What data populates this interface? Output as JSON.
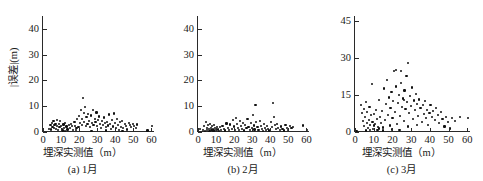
{
  "figure": {
    "panel_count": 3,
    "marker_color": "#111111",
    "axis_color": "#2a2a2a",
    "background": "#ffffff"
  },
  "chart_data": [
    {
      "type": "scatter",
      "title": "",
      "caption": "(a) 1月",
      "xlabel": "埋深实测值（m）",
      "ylabel": "|误差|(m)",
      "xlim": [
        0,
        62
      ],
      "ylim": [
        0,
        45
      ],
      "xticks": [
        0,
        10,
        20,
        30,
        40,
        50,
        60
      ],
      "xticklabels": [
        "0",
        "10",
        "20",
        "30",
        "40",
        "50",
        "60"
      ],
      "yticks": [
        0,
        10,
        20,
        30,
        40
      ],
      "yticklabels": [
        "0",
        "10",
        "20",
        "30",
        "40"
      ],
      "grid": false,
      "legend": false,
      "points": [
        [
          3.4,
          1.2
        ],
        [
          4.1,
          2.8
        ],
        [
          4.6,
          1.0
        ],
        [
          5.0,
          3.6
        ],
        [
          5.3,
          2.0
        ],
        [
          5.8,
          4.4
        ],
        [
          6.1,
          1.5
        ],
        [
          6.4,
          2.6
        ],
        [
          6.9,
          3.2
        ],
        [
          7.2,
          1.1
        ],
        [
          7.6,
          4.6
        ],
        [
          7.9,
          2.2
        ],
        [
          8.3,
          0.8
        ],
        [
          8.7,
          3.0
        ],
        [
          9.1,
          1.8
        ],
        [
          9.5,
          4.2
        ],
        [
          9.9,
          2.4
        ],
        [
          10.4,
          1.3
        ],
        [
          10.8,
          0.6
        ],
        [
          11.3,
          2.9
        ],
        [
          11.8,
          1.6
        ],
        [
          12.4,
          3.4
        ],
        [
          13.0,
          2.1
        ],
        [
          13.6,
          1.0
        ],
        [
          14.2,
          2.6
        ],
        [
          14.9,
          1.4
        ],
        [
          15.5,
          3.1
        ],
        [
          16.1,
          2.2
        ],
        [
          16.8,
          0.9
        ],
        [
          17.4,
          3.8
        ],
        [
          17.9,
          2.4
        ],
        [
          18.5,
          1.7
        ],
        [
          19.0,
          4.9
        ],
        [
          19.6,
          2.0
        ],
        [
          20.1,
          6.2
        ],
        [
          20.6,
          3.4
        ],
        [
          21.0,
          8.6
        ],
        [
          21.4,
          5.1
        ],
        [
          21.8,
          2.6
        ],
        [
          22.1,
          13.1
        ],
        [
          22.5,
          7.3
        ],
        [
          22.9,
          4.0
        ],
        [
          23.3,
          9.6
        ],
        [
          23.7,
          2.2
        ],
        [
          24.1,
          5.8
        ],
        [
          24.6,
          3.1
        ],
        [
          25.0,
          7.0
        ],
        [
          25.5,
          4.4
        ],
        [
          26.0,
          1.9
        ],
        [
          26.5,
          6.4
        ],
        [
          27.0,
          3.6
        ],
        [
          27.5,
          8.4
        ],
        [
          28.0,
          2.8
        ],
        [
          28.6,
          5.2
        ],
        [
          29.1,
          3.9
        ],
        [
          29.6,
          7.6
        ],
        [
          30.1,
          2.3
        ],
        [
          30.6,
          4.8
        ],
        [
          31.1,
          6.0
        ],
        [
          31.6,
          3.2
        ],
        [
          32.1,
          1.5
        ],
        [
          32.7,
          4.2
        ],
        [
          33.2,
          2.7
        ],
        [
          33.8,
          5.6
        ],
        [
          34.3,
          3.4
        ],
        [
          34.9,
          1.8
        ],
        [
          35.4,
          4.0
        ],
        [
          36.0,
          2.5
        ],
        [
          36.6,
          6.8
        ],
        [
          37.1,
          3.0
        ],
        [
          37.7,
          1.2
        ],
        [
          38.2,
          4.6
        ],
        [
          38.8,
          2.1
        ],
        [
          39.3,
          7.2
        ],
        [
          39.8,
          3.6
        ],
        [
          40.3,
          1.4
        ],
        [
          40.9,
          5.0
        ],
        [
          41.5,
          2.8
        ],
        [
          42.0,
          0.7
        ],
        [
          42.6,
          3.8
        ],
        [
          43.2,
          2.0
        ],
        [
          43.9,
          4.4
        ],
        [
          44.5,
          1.6
        ],
        [
          45.2,
          3.0
        ],
        [
          45.9,
          2.3
        ],
        [
          46.6,
          1.0
        ],
        [
          47.4,
          3.4
        ],
        [
          48.1,
          2.6
        ],
        [
          48.9,
          1.8
        ],
        [
          49.7,
          3.2
        ],
        [
          50.5,
          2.2
        ],
        [
          51.3,
          1.4
        ],
        [
          52.1,
          2.9
        ],
        [
          57.8,
          0.6
        ],
        [
          60.4,
          2.4
        ],
        [
          12.0,
          0.5
        ],
        [
          18.2,
          0.7
        ],
        [
          26.8,
          0.4
        ],
        [
          35.0,
          0.6
        ],
        [
          44.0,
          0.5
        ]
      ]
    },
    {
      "type": "scatter",
      "title": "",
      "caption": "(b) 2月",
      "xlabel": "埋深实测值（m）",
      "ylabel": "",
      "xlim": [
        0,
        62
      ],
      "ylim": [
        0,
        45
      ],
      "xticks": [
        0,
        10,
        20,
        30,
        40,
        50,
        60
      ],
      "xticklabels": [
        "0",
        "10",
        "20",
        "30",
        "40",
        "50",
        "60"
      ],
      "yticks": [
        0,
        10,
        20,
        30,
        40
      ],
      "yticklabels": [
        "0",
        "10",
        "20",
        "30",
        "40"
      ],
      "grid": false,
      "legend": false,
      "points": [
        [
          2.8,
          0.9
        ],
        [
          3.4,
          2.2
        ],
        [
          3.9,
          0.5
        ],
        [
          4.3,
          3.9
        ],
        [
          4.8,
          1.4
        ],
        [
          5.2,
          0.7
        ],
        [
          5.6,
          2.6
        ],
        [
          6.0,
          1.1
        ],
        [
          6.4,
          0.4
        ],
        [
          6.8,
          3.1
        ],
        [
          7.1,
          1.7
        ],
        [
          7.5,
          0.8
        ],
        [
          7.9,
          2.3
        ],
        [
          8.2,
          1.2
        ],
        [
          8.6,
          0.6
        ],
        [
          9.0,
          2.8
        ],
        [
          9.4,
          1.5
        ],
        [
          9.8,
          0.9
        ],
        [
          10.3,
          2.0
        ],
        [
          10.9,
          1.0
        ],
        [
          11.5,
          0.5
        ],
        [
          12.2,
          1.8
        ],
        [
          12.9,
          0.7
        ],
        [
          13.6,
          2.4
        ],
        [
          14.3,
          1.2
        ],
        [
          15.0,
          0.6
        ],
        [
          15.8,
          3.3
        ],
        [
          16.5,
          1.6
        ],
        [
          17.2,
          0.8
        ],
        [
          17.9,
          2.9
        ],
        [
          18.6,
          1.3
        ],
        [
          19.2,
          4.8
        ],
        [
          19.8,
          2.1
        ],
        [
          20.4,
          0.7
        ],
        [
          21.0,
          5.4
        ],
        [
          21.6,
          3.0
        ],
        [
          22.1,
          1.5
        ],
        [
          22.7,
          0.9
        ],
        [
          23.2,
          4.2
        ],
        [
          23.8,
          2.3
        ],
        [
          24.4,
          1.1
        ],
        [
          25.0,
          3.6
        ],
        [
          25.6,
          0.6
        ],
        [
          26.2,
          2.7
        ],
        [
          26.8,
          1.4
        ],
        [
          27.4,
          5.0
        ],
        [
          28.0,
          2.0
        ],
        [
          28.6,
          0.8
        ],
        [
          29.2,
          3.4
        ],
        [
          29.8,
          1.7
        ],
        [
          30.3,
          6.6
        ],
        [
          30.8,
          2.5
        ],
        [
          31.3,
          1.0
        ],
        [
          31.8,
          10.4
        ],
        [
          32.3,
          3.8
        ],
        [
          32.9,
          1.9
        ],
        [
          33.5,
          0.7
        ],
        [
          34.1,
          4.4
        ],
        [
          34.7,
          2.2
        ],
        [
          35.3,
          1.3
        ],
        [
          35.9,
          0.5
        ],
        [
          36.5,
          3.0
        ],
        [
          37.1,
          1.6
        ],
        [
          37.7,
          0.9
        ],
        [
          38.3,
          2.4
        ],
        [
          38.9,
          1.2
        ],
        [
          39.5,
          0.6
        ],
        [
          40.2,
          4.0
        ],
        [
          40.8,
          1.8
        ],
        [
          41.4,
          11.2
        ],
        [
          41.9,
          5.8
        ],
        [
          42.5,
          2.6
        ],
        [
          43.1,
          1.1
        ],
        [
          43.8,
          3.2
        ],
        [
          44.5,
          1.5
        ],
        [
          45.2,
          0.8
        ],
        [
          46.0,
          2.1
        ],
        [
          46.8,
          1.3
        ],
        [
          47.6,
          0.6
        ],
        [
          48.4,
          2.8
        ],
        [
          49.2,
          1.7
        ],
        [
          50.0,
          0.9
        ],
        [
          50.9,
          2.3
        ],
        [
          51.8,
          1.4
        ],
        [
          52.7,
          2.0
        ],
        [
          58.2,
          2.5
        ],
        [
          60.5,
          0.7
        ],
        [
          0.9,
          1.1
        ]
      ]
    },
    {
      "type": "scatter",
      "title": "",
      "caption": "(c) 3月",
      "xlabel": "埋深实测值（m）",
      "ylabel": "",
      "xlim": [
        0,
        62
      ],
      "ylim": [
        0,
        47
      ],
      "xticks": [
        0,
        10,
        20,
        30,
        40,
        50,
        60
      ],
      "xticklabels": [
        "0",
        "10",
        "20",
        "30",
        "40",
        "50",
        "60"
      ],
      "yticks": [
        0,
        15,
        30,
        45
      ],
      "yticklabels": [
        "0",
        "15",
        "30",
        "45"
      ],
      "grid": false,
      "legend": false,
      "points": [
        [
          3.2,
          11.0
        ],
        [
          3.8,
          7.8
        ],
        [
          4.2,
          4.6
        ],
        [
          4.6,
          9.4
        ],
        [
          5.0,
          2.4
        ],
        [
          5.4,
          6.2
        ],
        [
          5.8,
          12.2
        ],
        [
          6.2,
          3.6
        ],
        [
          6.6,
          8.0
        ],
        [
          7.0,
          1.6
        ],
        [
          7.4,
          5.0
        ],
        [
          7.8,
          10.2
        ],
        [
          8.2,
          2.8
        ],
        [
          8.6,
          6.8
        ],
        [
          9.0,
          19.6
        ],
        [
          9.4,
          4.0
        ],
        [
          9.8,
          1.2
        ],
        [
          10.3,
          7.4
        ],
        [
          10.8,
          3.2
        ],
        [
          11.3,
          9.0
        ],
        [
          11.8,
          5.4
        ],
        [
          12.3,
          2.0
        ],
        [
          12.9,
          13.0
        ],
        [
          13.4,
          6.0
        ],
        [
          13.9,
          3.8
        ],
        [
          14.4,
          8.6
        ],
        [
          15.0,
          1.8
        ],
        [
          15.5,
          17.6
        ],
        [
          16.0,
          4.8
        ],
        [
          16.5,
          11.4
        ],
        [
          17.0,
          21.0
        ],
        [
          17.5,
          7.0
        ],
        [
          18.0,
          14.0
        ],
        [
          18.5,
          2.6
        ],
        [
          19.0,
          9.8
        ],
        [
          19.5,
          16.2
        ],
        [
          20.0,
          5.6
        ],
        [
          20.5,
          12.6
        ],
        [
          21.0,
          24.6
        ],
        [
          21.5,
          8.2
        ],
        [
          22.0,
          18.4
        ],
        [
          22.5,
          3.4
        ],
        [
          23.0,
          11.8
        ],
        [
          23.5,
          15.0
        ],
        [
          24.0,
          6.6
        ],
        [
          24.5,
          20.0
        ],
        [
          25.0,
          10.0
        ],
        [
          25.5,
          13.6
        ],
        [
          26.0,
          4.4
        ],
        [
          26.5,
          16.8
        ],
        [
          27.0,
          9.2
        ],
        [
          27.5,
          22.6
        ],
        [
          28.0,
          12.0
        ],
        [
          28.5,
          27.8
        ],
        [
          29.0,
          7.6
        ],
        [
          29.5,
          14.6
        ],
        [
          30.0,
          10.6
        ],
        [
          30.5,
          18.0
        ],
        [
          31.0,
          5.2
        ],
        [
          31.5,
          12.8
        ],
        [
          32.0,
          8.8
        ],
        [
          32.6,
          15.4
        ],
        [
          33.2,
          11.2
        ],
        [
          33.8,
          6.4
        ],
        [
          34.4,
          13.2
        ],
        [
          35.0,
          9.6
        ],
        [
          35.6,
          4.2
        ],
        [
          36.2,
          10.8
        ],
        [
          36.8,
          7.2
        ],
        [
          37.4,
          12.4
        ],
        [
          38.0,
          5.8
        ],
        [
          38.6,
          9.0
        ],
        [
          39.2,
          3.0
        ],
        [
          39.8,
          7.8
        ],
        [
          40.4,
          11.0
        ],
        [
          41.0,
          6.2
        ],
        [
          41.8,
          8.4
        ],
        [
          42.6,
          4.8
        ],
        [
          43.4,
          9.8
        ],
        [
          44.2,
          6.8
        ],
        [
          45.0,
          3.6
        ],
        [
          45.8,
          8.0
        ],
        [
          46.8,
          5.4
        ],
        [
          47.8,
          2.2
        ],
        [
          48.8,
          6.0
        ],
        [
          49.8,
          4.0
        ],
        [
          50.8,
          1.4
        ],
        [
          52.0,
          5.6
        ],
        [
          53.5,
          4.4
        ],
        [
          56.0,
          6.0
        ],
        [
          60.5,
          5.8
        ],
        [
          0.8,
          0.4
        ],
        [
          14.8,
          0.6
        ],
        [
          19.8,
          1.0
        ],
        [
          23.8,
          0.8
        ],
        [
          28.2,
          2.2
        ],
        [
          33.0,
          3.0
        ],
        [
          21.8,
          25.0
        ],
        [
          24.8,
          24.8
        ],
        [
          26.2,
          13.0
        ],
        [
          12.0,
          0.8
        ],
        [
          13.0,
          1.4
        ],
        [
          10.0,
          2.6
        ],
        [
          8.0,
          0.8
        ],
        [
          6.0,
          0.6
        ]
      ]
    }
  ]
}
